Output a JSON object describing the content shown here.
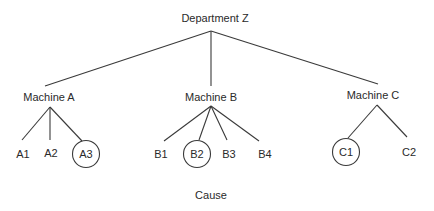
{
  "diagram": {
    "type": "tree",
    "root": {
      "label": "Department Z",
      "children": [
        {
          "label": "Machine A",
          "children": [
            {
              "label": "A1",
              "circled": false
            },
            {
              "label": "A2",
              "circled": false
            },
            {
              "label": "A3",
              "circled": true
            }
          ]
        },
        {
          "label": "Machine B",
          "children": [
            {
              "label": "B1",
              "circled": false
            },
            {
              "label": "B2",
              "circled": true
            },
            {
              "label": "B3",
              "circled": false
            },
            {
              "label": "B4",
              "circled": false
            }
          ]
        },
        {
          "label": "Machine C",
          "children": [
            {
              "label": "C1",
              "circled": true
            },
            {
              "label": "C2",
              "circled": false
            }
          ]
        }
      ]
    },
    "caption": "Cause",
    "colors": {
      "line": "#3a3a3a",
      "text": "#2a2a2a",
      "background": "#ffffff"
    }
  }
}
